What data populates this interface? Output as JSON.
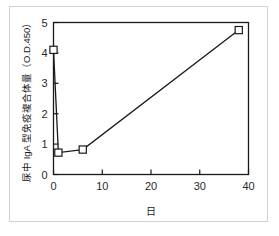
{
  "chart_data": {
    "type": "line",
    "title": "",
    "subtitle": "",
    "xlabel": "日",
    "ylabel": "尿中 IgA 型免疫複合体量（O.D.450）",
    "xlim": [
      0,
      40
    ],
    "ylim": [
      0,
      5
    ],
    "xticks": [
      0,
      10,
      20,
      30,
      40
    ],
    "xtick_labels": [
      "0",
      "10",
      "20",
      "30",
      "40"
    ],
    "yticks": [
      0,
      1,
      2,
      3,
      4,
      5
    ],
    "ytick_labels": [
      "0",
      "1",
      "2",
      "3",
      "4",
      "5"
    ],
    "grid": false,
    "legend": false,
    "legend_position": "none",
    "marker": "open-square",
    "line_color": "#1a1a1a",
    "marker_fill": "#ffffff",
    "marker_edge": "#1a1a1a",
    "series": [
      {
        "name": "urinary IgA immune complex",
        "x": [
          0,
          1,
          6,
          38
        ],
        "y": [
          4.1,
          0.72,
          0.82,
          4.75
        ]
      }
    ],
    "points": [
      {
        "x": 0,
        "y": 4.1
      },
      {
        "x": 1,
        "y": 0.72
      },
      {
        "x": 6,
        "y": 0.82
      },
      {
        "x": 38,
        "y": 4.75
      }
    ]
  },
  "figure": {
    "frame_color": "#d2d2d2",
    "axis_color": "#1a1a1a",
    "background": "#ffffff"
  }
}
